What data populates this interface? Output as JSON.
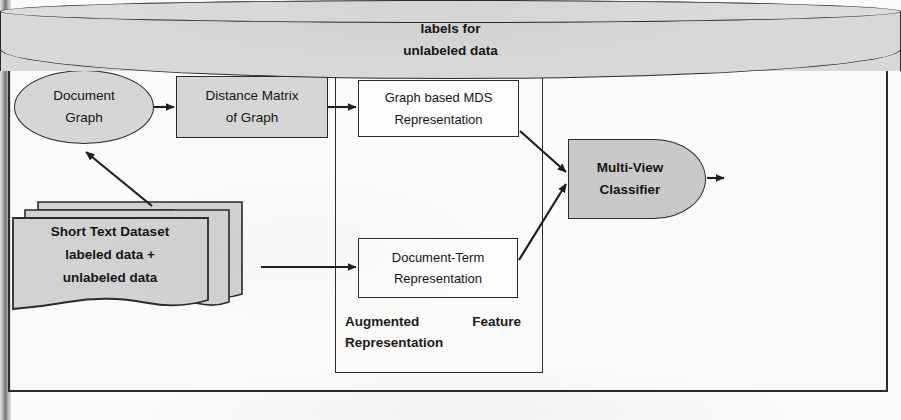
{
  "diagram": {
    "title": "Transductive Scenario",
    "nodes": {
      "document_graph": {
        "line1": "Document",
        "line2": "Graph"
      },
      "distance_matrix": {
        "line1": "Distance Matrix",
        "line2": "of Graph"
      },
      "graph_mds": {
        "line1": "Graph based MDS",
        "line2": "Representation"
      },
      "document_term": {
        "line1": "Document-Term",
        "line2": "Representation"
      },
      "dataset": {
        "line1": "Short Text Dataset",
        "line2": "labeled data +",
        "line3": "unlabeled data"
      },
      "classifier": {
        "line1": "Multi-View",
        "line2": "Classifier"
      },
      "output_store": {
        "line1": "labels for",
        "line2": "unlabeled data"
      }
    },
    "groups": {
      "augmented_feature": {
        "word1": "Augmented",
        "word2": "Feature",
        "line2": "Representation"
      }
    },
    "colors": {
      "fill_gray": "#d6d6d6",
      "fill_gray_dark": "#c9c9c9",
      "stroke": "#2b2b2b",
      "text": "#151515",
      "page_background": "#fbfbfa"
    }
  }
}
